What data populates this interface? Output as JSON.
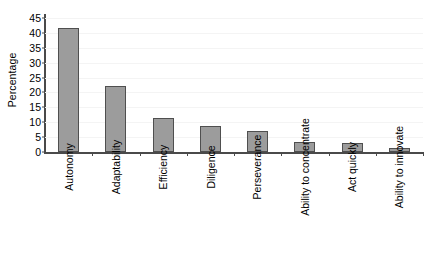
{
  "chart_data": {
    "type": "bar",
    "title": "",
    "xlabel": "",
    "ylabel": "Percentage",
    "ylim": [
      0,
      45
    ],
    "ytick_labels": [
      "0",
      "5",
      "10",
      "15",
      "20",
      "25",
      "30",
      "35",
      "40",
      "45"
    ],
    "ytick_values": [
      0,
      5,
      10,
      15,
      20,
      25,
      30,
      35,
      40,
      45
    ],
    "grid": true,
    "legend": false,
    "categories": [
      "Autonomy",
      "Adaptability",
      "Efficiency",
      "Diligence",
      "Perseverance",
      "Ability to concentrate",
      "Act quickly",
      "Ability to innovate"
    ],
    "values": [
      41.6,
      22.3,
      11.3,
      8.8,
      7.2,
      3.5,
      3.0,
      1.3
    ],
    "bar_color": "#9c9c9c",
    "bar_edge_color": "#4f4f4f",
    "axis_color": "#4a4a4a",
    "grid_color": "#f4f4f4",
    "background": "#ffffff"
  }
}
